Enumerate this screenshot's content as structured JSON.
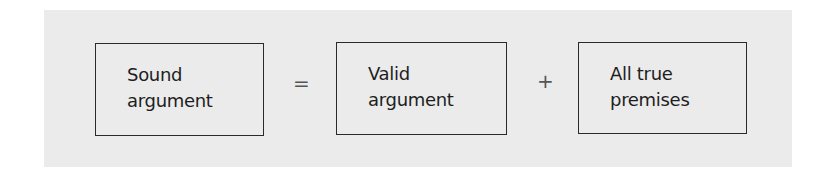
{
  "diagram": {
    "boxes": [
      {
        "line1": "Sound",
        "line2": "argument"
      },
      {
        "line1": "Valid",
        "line2": "argument"
      },
      {
        "line1": "All true",
        "line2": "premises"
      }
    ],
    "operators": [
      "=",
      "+"
    ],
    "colors": {
      "panel": "#ebebeb",
      "border": "#2a2a2a",
      "text": "#1e1e1e"
    }
  }
}
